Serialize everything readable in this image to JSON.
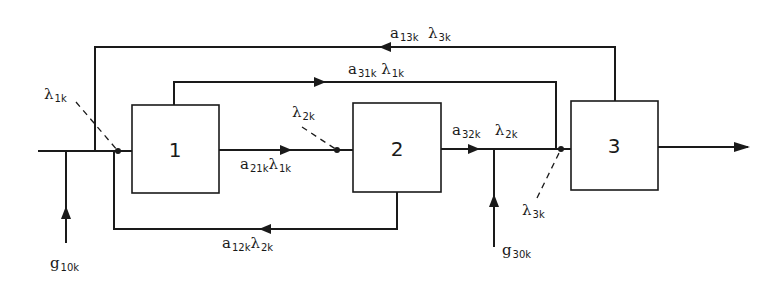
{
  "diagram": {
    "type": "block-flow-diagram",
    "blocks": [
      {
        "id": "1",
        "label": "1"
      },
      {
        "id": "2",
        "label": "2"
      },
      {
        "id": "3",
        "label": "3"
      }
    ],
    "labels": {
      "lambda_1k": {
        "sym": "λ",
        "sub": "1k"
      },
      "lambda_2k_top": {
        "sym": "λ",
        "sub": "2k"
      },
      "lambda_3k": {
        "sym": "λ",
        "sub": "3k"
      },
      "a21k": {
        "sym": "a",
        "sub": "21k"
      },
      "a21k_lambda": {
        "sym": "λ",
        "sub": "1k"
      },
      "a12k": {
        "sym": "a",
        "sub": "12k"
      },
      "a12k_lambda": {
        "sym": "λ",
        "sub": "2k"
      },
      "a32k": {
        "sym": "a",
        "sub": "32k"
      },
      "a32k_lambda": {
        "sym": "λ",
        "sub": "2k"
      },
      "a31k": {
        "sym": "a",
        "sub": "31k"
      },
      "a31k_lambda": {
        "sym": "λ",
        "sub": "1k"
      },
      "a13k": {
        "sym": "a",
        "sub": "13k"
      },
      "a13k_lambda": {
        "sym": "λ",
        "sub": "3k"
      },
      "g10k": {
        "sym": "g",
        "sub": "10k"
      },
      "g30k": {
        "sym": "g",
        "sub": "30k"
      }
    },
    "line_color": "#1a1a1a"
  }
}
